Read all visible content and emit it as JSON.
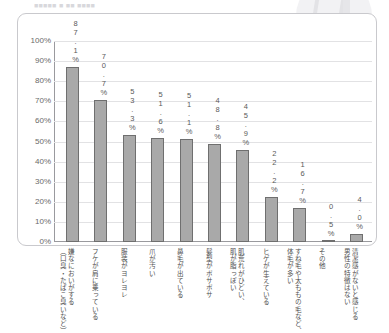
{
  "page_header": "■■■■■ ■ ■■ ■■■■",
  "watermark": {
    "name": "circular-logo-watermark"
  },
  "chart_data": {
    "type": "bar",
    "title": "",
    "xlabel": "",
    "ylabel": "",
    "ylim": [
      0,
      100
    ],
    "ytick_labels": [
      "100%",
      "90%",
      "80%",
      "70%",
      "60%",
      "50%",
      "40%",
      "30%",
      "20%",
      "10%",
      "0%"
    ],
    "ytick_values": [
      100,
      90,
      80,
      70,
      60,
      50,
      40,
      30,
      20,
      10,
      0
    ],
    "grid": true,
    "legend": "none",
    "bar_color": "#a9a9a9",
    "bar_border_color": "#6f6f6f",
    "categories": [
      [
        "嫌なにおいがする",
        "（口臭・たばこ臭いなど）"
      ],
      [
        "フケが肩に乗っている"
      ],
      [
        "服装がヨレヨレ"
      ],
      [
        "爪が汚い"
      ],
      [
        "鼻毛が出ている"
      ],
      [
        "髪型がボサボサ"
      ],
      [
        "肌荒れがひどい、",
        "肌が脂っぽい"
      ],
      [
        "ヒゲが生えている"
      ],
      [
        "すね毛や太ももの毛など、",
        "体毛が多い"
      ],
      [
        "その他"
      ],
      [
        "清潔感がないと感じる",
        "男性の特徴はない"
      ]
    ],
    "values": [
      87.1,
      70.7,
      53.3,
      51.6,
      51.1,
      48.8,
      45.9,
      22.2,
      16.7,
      0.5,
      4.0
    ],
    "value_labels": [
      "87.1%",
      "70.7%",
      "53.3%",
      "51.6%",
      "51.1%",
      "48.8%",
      "45.9%",
      "22.2%",
      "16.7%",
      "0.5%",
      "4.0%"
    ]
  }
}
